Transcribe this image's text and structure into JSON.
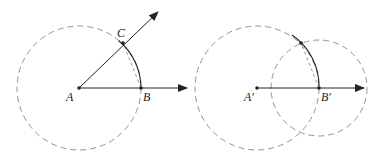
{
  "figure": {
    "left_panel": {
      "labels": {
        "A": "A",
        "B": "B",
        "C": "C"
      },
      "points": {
        "A": [
          79,
          88
        ],
        "B": [
          141,
          88
        ],
        "C": [
          123,
          43
        ]
      },
      "circle": {
        "center": "A",
        "radius": 62,
        "style": "dashed"
      },
      "arc": {
        "from": "B",
        "to": "C",
        "style": "solid"
      },
      "chord": {
        "from": "B",
        "to": "C",
        "style": "dashed"
      },
      "rays": [
        {
          "from": "A",
          "through": "B",
          "end": [
            187,
            88
          ]
        },
        {
          "from": "A",
          "through": "C",
          "end": [
            158,
            12
          ]
        }
      ]
    },
    "right_panel": {
      "labels": {
        "A": "A′",
        "B": "B′"
      },
      "points": {
        "A": [
          257,
          88
        ],
        "B": [
          319,
          88
        ],
        "C": [
          301,
          43
        ]
      },
      "circles": [
        {
          "center": "A′",
          "radius": 62,
          "style": "dashed"
        },
        {
          "center": "B′",
          "radius": 48,
          "style": "dashed"
        }
      ],
      "arc": {
        "center": "A′",
        "from": "B′",
        "to": "intersection",
        "style": "solid"
      },
      "chord": {
        "from": "B′",
        "to": "intersection",
        "style": "dashed"
      },
      "rays": [
        {
          "from": "A′",
          "through": "B′",
          "end": [
            364,
            88
          ]
        }
      ]
    },
    "colors": {
      "stroke": "#222222",
      "dashed": "#888888"
    }
  }
}
